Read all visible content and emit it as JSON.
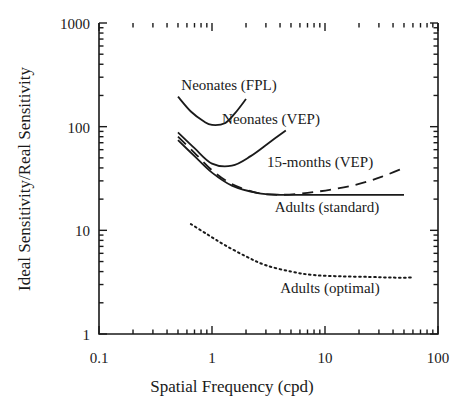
{
  "chart_data": {
    "type": "line",
    "title": "",
    "xlabel": "Spatial Frequency (cpd)",
    "ylabel": "Ideal Sensitivity/Real Sensitivity",
    "xscale": "log",
    "yscale": "log",
    "xlim": [
      0.1,
      100
    ],
    "ylim": [
      1,
      1000
    ],
    "xticks": [
      0.1,
      1,
      10,
      100
    ],
    "xticklabels": [
      "0.1",
      "1",
      "10",
      "100"
    ],
    "yticks": [
      1,
      10,
      100,
      1000
    ],
    "yticklabels": [
      "1",
      "10",
      "100",
      "1000"
    ],
    "grid": false,
    "legend": "inline-annotations",
    "series": [
      {
        "name": "Neonates (FPL)",
        "style": "solid",
        "label": "Neonates (FPL)",
        "x": [
          0.5,
          0.65,
          0.85,
          1.0,
          1.3,
          1.6,
          2.0
        ],
        "y": [
          195,
          140,
          112,
          104,
          108,
          135,
          185
        ]
      },
      {
        "name": "Neonates (VEP)",
        "style": "solid",
        "label": "Neonates (VEP)",
        "x": [
          0.5,
          0.7,
          1.0,
          1.5,
          2.2,
          3.2,
          4.5
        ],
        "y": [
          88,
          62,
          44,
          42,
          52,
          70,
          92
        ]
      },
      {
        "name": "15-months (VEP)",
        "style": "dashed",
        "label": "15-months (VEP)",
        "x": [
          0.5,
          0.7,
          1.0,
          1.5,
          2.5,
          4,
          7,
          12,
          20,
          32,
          50
        ],
        "y": [
          80,
          56,
          38,
          28,
          23,
          22,
          23,
          25,
          28,
          33,
          40
        ]
      },
      {
        "name": "Adults (standard)",
        "style": "solid",
        "label": "Adults (standard)",
        "x": [
          0.5,
          0.7,
          1.0,
          1.5,
          2.5,
          4,
          7,
          12,
          20,
          32,
          50
        ],
        "y": [
          74,
          52,
          36,
          27,
          23,
          22,
          22,
          22,
          22,
          22,
          22
        ]
      },
      {
        "name": "Adults (optimal)",
        "style": "dotted",
        "label": "Adults (optimal)",
        "x": [
          0.65,
          0.9,
          1.3,
          2.0,
          3.0,
          5.0,
          8.0,
          14,
          25,
          40,
          60
        ],
        "y": [
          11.5,
          9.2,
          7.2,
          5.6,
          4.6,
          4.0,
          3.7,
          3.6,
          3.55,
          3.5,
          3.5
        ]
      }
    ],
    "annotations": [
      {
        "text": "Neonates (FPL)",
        "x_px": 229,
        "y_px": 90
      },
      {
        "text": "Neonates (VEP)",
        "x_px": 271,
        "y_px": 124
      },
      {
        "text": "15-months (VEP)",
        "x_px": 320,
        "y_px": 167
      },
      {
        "text": "Adults (standard)",
        "x_px": 327,
        "y_px": 212
      },
      {
        "text": "Adults (optimal)",
        "x_px": 330,
        "y_px": 293
      }
    ]
  },
  "axes": {
    "y_title": "Ideal Sensitivity/Real Sensitivity",
    "x_title": "Spatial Frequency (cpd)",
    "y_tick_1000": "1000",
    "y_tick_100": "100",
    "y_tick_10": "10",
    "y_tick_1": "1",
    "x_tick_01": "0.1",
    "x_tick_1": "1",
    "x_tick_10": "10",
    "x_tick_100": "100"
  },
  "colors": {
    "line": "#1a1a1a",
    "axis": "#1a1a1a",
    "background": "#ffffff"
  }
}
